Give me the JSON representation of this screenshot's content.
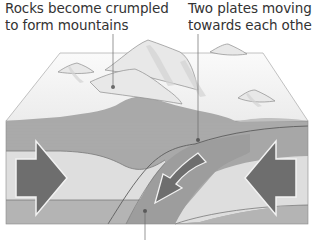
{
  "figure": {
    "labels": {
      "mountains": {
        "line1": "Rocks become crumpled",
        "line2": "to form mountains"
      },
      "plates": {
        "line1": "Two plates moving",
        "line2": "towards each other"
      }
    },
    "colors": {
      "background": "#ffffff",
      "text": "#333333",
      "surface_snow": "#f4f4f4",
      "surface_shade": "#dcdcdc",
      "upper_crust": "#a9a9a9",
      "light_layer": "#dedede",
      "lower_layer": "#b4b4b4",
      "subducting_plate": "#9d9d9d",
      "arrow": "#6e6e6e",
      "arrow_outline": "#f2f2f2",
      "leader_line": "#6a6a6a"
    },
    "arrows": [
      {
        "name": "left-push-arrow",
        "direction": "right"
      },
      {
        "name": "right-push-arrow",
        "direction": "left"
      },
      {
        "name": "subduction-arrow",
        "direction": "down-left"
      }
    ],
    "callout_points": [
      {
        "name": "mountains-callout",
        "target": "mountain surface"
      },
      {
        "name": "plate-boundary-callout",
        "target": "plate boundary"
      },
      {
        "name": "subducting-plate-callout",
        "target": "subducting plate"
      }
    ]
  }
}
